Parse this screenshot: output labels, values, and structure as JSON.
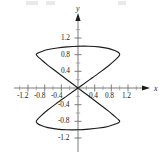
{
  "figure": {
    "name": "lissajous-curve-plot",
    "background": "#ffffff",
    "ink_color": "#1b1b1b",
    "axis_color": "#6e6e6e"
  },
  "axes": {
    "x_axis_label": "x",
    "y_axis_label": "y",
    "x_ticks": [
      "-1.2",
      "-0.8",
      "-0.4",
      "0.4",
      "0.8",
      "1.2"
    ],
    "y_ticks": [
      "1.2",
      "0.8",
      "0.4",
      "-0.4",
      "-0.8",
      "-1.2"
    ],
    "x_tick_values": [
      -1.2,
      -0.8,
      -0.4,
      0.4,
      0.8,
      1.2
    ],
    "y_tick_values": [
      1.2,
      0.8,
      0.4,
      -0.4,
      -0.8,
      -1.2
    ],
    "minor_ticks_per_interval": 1,
    "origin_label": ""
  },
  "chart_data": {
    "type": "line",
    "title": "",
    "xlabel": "x",
    "ylabel": "y",
    "xlim": [
      -1.35,
      1.35
    ],
    "ylim": [
      -1.35,
      1.35
    ],
    "grid": false,
    "legend": null,
    "xticks": [
      -1.2,
      -0.8,
      -0.4,
      0.4,
      0.8,
      1.2
    ],
    "yticks": [
      1.2,
      0.8,
      0.4,
      -0.4,
      -0.8,
      -1.2
    ],
    "crossing_points_y": [
      0.8,
      0.0,
      -0.8
    ],
    "x_extent": [
      -1.0,
      1.0
    ],
    "y_extent": [
      -1.0,
      1.0
    ],
    "series": [
      {
        "name": "curve",
        "closed": true,
        "color": "#1b1b1b",
        "linewidth": 1.1,
        "points": [
          [
            0.0,
            0.0
          ],
          [
            0.28,
            0.2
          ],
          [
            0.53,
            0.38
          ],
          [
            0.74,
            0.54
          ],
          [
            0.88,
            0.66
          ],
          [
            0.97,
            0.75
          ],
          [
            1.0,
            0.8
          ],
          [
            0.97,
            0.85
          ],
          [
            0.88,
            0.9
          ],
          [
            0.72,
            0.95
          ],
          [
            0.5,
            0.985
          ],
          [
            0.26,
            1.0
          ],
          [
            0.0,
            1.0
          ],
          [
            -0.26,
            0.985
          ],
          [
            -0.5,
            0.96
          ],
          [
            -0.72,
            0.92
          ],
          [
            -0.88,
            0.87
          ],
          [
            -0.97,
            0.83
          ],
          [
            -1.0,
            0.8
          ],
          [
            -0.97,
            0.76
          ],
          [
            -0.88,
            0.68
          ],
          [
            -0.74,
            0.56
          ],
          [
            -0.53,
            0.4
          ],
          [
            -0.28,
            0.21
          ],
          [
            0.0,
            0.0
          ],
          [
            0.28,
            -0.21
          ],
          [
            0.53,
            -0.4
          ],
          [
            0.74,
            -0.56
          ],
          [
            0.88,
            -0.68
          ],
          [
            0.97,
            -0.76
          ],
          [
            1.0,
            -0.8
          ],
          [
            0.97,
            -0.83
          ],
          [
            0.88,
            -0.87
          ],
          [
            0.72,
            -0.92
          ],
          [
            0.5,
            -0.96
          ],
          [
            0.26,
            -0.985
          ],
          [
            0.0,
            -1.0
          ],
          [
            -0.26,
            -1.0
          ],
          [
            -0.5,
            -0.985
          ],
          [
            -0.72,
            -0.95
          ],
          [
            -0.88,
            -0.9
          ],
          [
            -0.97,
            -0.85
          ],
          [
            -1.0,
            -0.8
          ],
          [
            -0.97,
            -0.75
          ],
          [
            -0.88,
            -0.66
          ],
          [
            -0.74,
            -0.54
          ],
          [
            -0.53,
            -0.38
          ],
          [
            -0.28,
            -0.2
          ],
          [
            0.0,
            0.0
          ]
        ],
        "lobes": [
          {
            "name": "upper-thin-lobe",
            "y_range": [
              0.8,
              1.0
            ],
            "x_range": [
              -1.0,
              1.0
            ]
          },
          {
            "name": "upper-wide-lobe",
            "y_range": [
              0.0,
              0.8
            ],
            "x_range": [
              -1.0,
              1.0
            ]
          },
          {
            "name": "lower-wide-lobe",
            "y_range": [
              -0.8,
              0.0
            ],
            "x_range": [
              -1.0,
              1.0
            ]
          },
          {
            "name": "lower-thin-lobe",
            "y_range": [
              -1.0,
              -0.8
            ],
            "x_range": [
              -1.0,
              1.0
            ]
          }
        ]
      }
    ]
  }
}
